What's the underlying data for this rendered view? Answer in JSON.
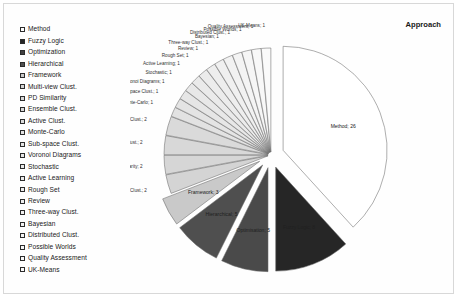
{
  "chart_title": "Approach",
  "legend": {
    "items": [
      {
        "label": "Method",
        "color": "#ffffff"
      },
      {
        "label": "Fuzzy Logic",
        "color": "#262626"
      },
      {
        "label": "Optimization",
        "color": "#404040"
      },
      {
        "label": "Hierarchical",
        "color": "#4f4f4f"
      },
      {
        "label": "Framework",
        "color": "#c9c9c9"
      },
      {
        "label": "Multi-view Clust.",
        "color": "#d4d4d4"
      },
      {
        "label": "PD Similarity",
        "color": "#d6d6d6"
      },
      {
        "label": "Ensemble Clust.",
        "color": "#d8d8d8"
      },
      {
        "label": "Active Clust.",
        "color": "#dadada"
      },
      {
        "label": "Monte-Carlo",
        "color": "#e2e2e2"
      },
      {
        "label": "Sub-space Clust.",
        "color": "#e4e4e4"
      },
      {
        "label": "Voronoi Diagrams",
        "color": "#e6e6e6"
      },
      {
        "label": "Stochastic",
        "color": "#e8e8e8"
      },
      {
        "label": "Active Learning",
        "color": "#eaeaea"
      },
      {
        "label": "Rough Set",
        "color": "#ececec"
      },
      {
        "label": "Review",
        "color": "#eeeeee"
      },
      {
        "label": "Three-way Clust.",
        "color": "#f0f0f0"
      },
      {
        "label": "Bayesian",
        "color": "#f2f2f2"
      },
      {
        "label": "Distributed Clust.",
        "color": "#f4f4f4"
      },
      {
        "label": "Possible Worlds",
        "color": "#f6f6f6"
      },
      {
        "label": "Quality Assessment",
        "color": "#f8f8f8"
      },
      {
        "label": "UK-Means",
        "color": "#fafafa"
      }
    ]
  },
  "chart_data": {
    "type": "pie",
    "title": "Approach",
    "exploded": true,
    "total": 67,
    "label_format": "name; value",
    "legend_position": "left",
    "categories": [
      "Method",
      "Fuzzy Logic",
      "Optimisation",
      "Hierarchical",
      "Framework",
      "Multi-view Clust.",
      "PD Similarity",
      "Ensemble Clust.",
      "Active Clust.",
      "Monte-Carlo",
      "Sub-space Clust.",
      "Voronoi Diagrams",
      "Stochastic",
      "Active Learning",
      "Rough Set",
      "Review",
      "Three-way Clust.",
      "Bayesian",
      "Distributed Clust.",
      "Possible Worlds",
      "Quality Assessment",
      "UK-Means"
    ],
    "values": [
      26,
      8,
      5,
      5,
      3,
      2,
      2,
      2,
      2,
      1,
      1,
      1,
      1,
      1,
      1,
      1,
      1,
      1,
      1,
      1,
      1,
      1
    ],
    "colors": [
      "#ffffff",
      "#262626",
      "#4a4a4a",
      "#4f4f4f",
      "#c9c9c9",
      "#d4d4d4",
      "#d6d6d6",
      "#d8d8d8",
      "#dadada",
      "#e2e2e2",
      "#e4e4e4",
      "#e6e6e6",
      "#e8e8e8",
      "#eaeaea",
      "#ececec",
      "#eeeeee",
      "#f0f0f0",
      "#f2f2f2",
      "#f4f4f4",
      "#f6f6f6",
      "#f8f8f8",
      "#fafafa"
    ],
    "data_labels": [
      "Method; 26",
      "Fuzzy Logic; 8",
      "Optimisation; 5",
      "Hierarchical; 5",
      "Framework; 3",
      "Multi-view Clust.; 2",
      "PD Similarity; 2",
      "Ensemble Clust.; 2",
      "Active Clust.; 2",
      "Monte-Carlo; 1",
      "Sub-space Clust.; 1",
      "Voronoi Diagrams; 1",
      "Stochastic; 1",
      "Active Learning; 1",
      "Rough Set; 1",
      "Review; 1",
      "Three-way Clust.; 1",
      "Bayesian; 1",
      "Distributed Clust.; 1",
      "Possible Worlds; 1",
      "Quality Assessment; 1",
      "UK-Means; 1"
    ]
  }
}
